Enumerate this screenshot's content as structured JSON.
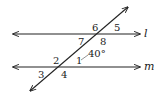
{
  "figure": {
    "type": "parallel lines cut by a transversal",
    "lines": [
      {
        "id": "l",
        "label": "l"
      },
      {
        "id": "m",
        "label": "m"
      }
    ],
    "angles": {
      "a1": "1",
      "a2": "2",
      "a3": "3",
      "a4": "4",
      "a5": "5",
      "a6": "6",
      "a7": "7",
      "a8": "8"
    },
    "given_angle": {
      "angle": "1",
      "measure": "40°"
    }
  }
}
